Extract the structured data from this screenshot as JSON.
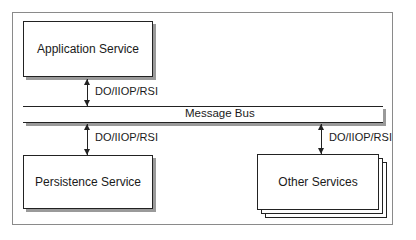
{
  "diagram": {
    "nodes": {
      "application_service": "Application Service",
      "message_bus": "Message Bus",
      "persistence_service": "Persistence Service",
      "other_services": "Other Services"
    },
    "edges": [
      {
        "from": "Application Service",
        "to": "Message Bus",
        "label": "DO/IIOP/RSI",
        "direction": "bidirectional"
      },
      {
        "from": "Message Bus",
        "to": "Persistence Service",
        "label": "DO/IIOP/RSI",
        "direction": "bidirectional"
      },
      {
        "from": "Message Bus",
        "to": "Other Services",
        "label": "DO/IIOP/RSI",
        "direction": "bidirectional"
      }
    ],
    "colors": {
      "stroke": "#222222",
      "shadow": "#9a9a9a",
      "frame": "#8a8a8a",
      "background": "#ffffff"
    }
  }
}
